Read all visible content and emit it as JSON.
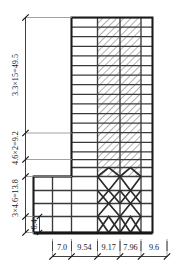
{
  "drawing": {
    "title": "Structural elevation with shear walls and chevron braces",
    "line_color": "#3a3a3a",
    "heavy_line_color": "#202020",
    "hatch_color": "#6f6f6f",
    "brace_color": "#2b2b2b",
    "background": "#ffffff"
  },
  "vertical_dimensions": [
    {
      "id": "upper",
      "label": "3.3×15=49.5",
      "value": 49.5,
      "count": 15,
      "spacing": 3.3
    },
    {
      "id": "mid",
      "label": "4.6×2=9.2",
      "value": 9.2,
      "count": 2,
      "spacing": 4.6
    },
    {
      "id": "lower",
      "label": "3×4.6=13.8",
      "value": 13.8,
      "count": 3,
      "spacing": 4.6
    },
    {
      "id": "base",
      "label": "6.4",
      "value": 6.4,
      "count": 1,
      "spacing": 6.4
    }
  ],
  "horizontal_dimensions": {
    "labels": [
      "7.0",
      "9.54",
      "9.17",
      "7.96",
      "9.6"
    ],
    "values": [
      7.0,
      9.54,
      9.17,
      7.96,
      9.6
    ]
  },
  "bays": {
    "count": 5,
    "shear_wall_bays": [
      2,
      3
    ],
    "braced_bays": [
      2,
      3
    ]
  },
  "annotations": {
    "unit_note": ""
  }
}
